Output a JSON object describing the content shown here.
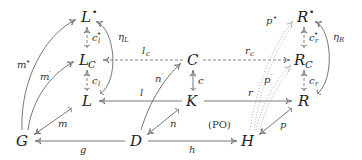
{
  "diagram": {
    "title": "",
    "nodes": {
      "L_bullet": {
        "base": "L",
        "sup": "•"
      },
      "L_C": {
        "base": "L",
        "sub": "C"
      },
      "L": {
        "base": "L"
      },
      "C": {
        "base": "C"
      },
      "K": {
        "base": "K"
      },
      "R_bullet": {
        "base": "R",
        "sup": "•"
      },
      "R_C": {
        "base": "R",
        "sub": "C"
      },
      "R": {
        "base": "R"
      },
      "G": {
        "base": "G"
      },
      "D": {
        "base": "D"
      },
      "H": {
        "base": "H"
      }
    },
    "annotation": "(PO)",
    "edges": [
      {
        "from": "L_C",
        "to": "L_bullet",
        "label": "c",
        "label_sub": "l",
        "label_sup": "•",
        "style": "dashed-mono"
      },
      {
        "from": "L",
        "to": "L_C",
        "label": "c",
        "label_sub": "l",
        "style": "dashed-mono"
      },
      {
        "from": "L",
        "to": "L_bullet",
        "label": "η",
        "label_sub": "L",
        "style": "curved"
      },
      {
        "from": "C",
        "to": "L_C",
        "label": "l",
        "label_sub": "c",
        "style": "dashed"
      },
      {
        "from": "C",
        "to": "R_C",
        "label": "r",
        "label_sub": "c",
        "style": "dashed"
      },
      {
        "from": "K",
        "to": "C",
        "label": "c",
        "style": "mono"
      },
      {
        "from": "K",
        "to": "L",
        "label": "l",
        "style": "solid"
      },
      {
        "from": "K",
        "to": "R",
        "label": "r",
        "style": "solid"
      },
      {
        "from": "R_C",
        "to": "R_bullet",
        "label": "c",
        "label_sub": "r",
        "label_sup": "•",
        "style": "dashed-mono"
      },
      {
        "from": "R",
        "to": "R_C",
        "label": "c",
        "label_sub": "r",
        "style": "dashed-mono"
      },
      {
        "from": "R",
        "to": "R_bullet",
        "label": "η",
        "label_sub": "R",
        "style": "curved"
      },
      {
        "from": "G",
        "to": "L_bullet",
        "label": "m",
        "label_sup": "•",
        "style": "curved"
      },
      {
        "from": "G",
        "to": "L_C",
        "label": "m",
        "label_sup": "′",
        "style": "curved"
      },
      {
        "from": "L",
        "to": "G",
        "label": "m",
        "style": "mono"
      },
      {
        "from": "D",
        "to": "G",
        "label": "g",
        "style": "solid"
      },
      {
        "from": "D",
        "to": "C",
        "label": "n",
        "label_sup": "′",
        "style": "curved"
      },
      {
        "from": "K",
        "to": "D",
        "label": "n",
        "style": "mono"
      },
      {
        "from": "D",
        "to": "H",
        "label": "h",
        "style": "solid"
      },
      {
        "from": "H",
        "to": "R_bullet",
        "label": "p",
        "label_sup": "•",
        "style": "dotted-curved"
      },
      {
        "from": "H",
        "to": "R_C",
        "label": "p",
        "label_sup": "′",
        "style": "dotted-curved"
      },
      {
        "from": "R",
        "to": "H",
        "label": "p",
        "style": "mono"
      }
    ]
  }
}
